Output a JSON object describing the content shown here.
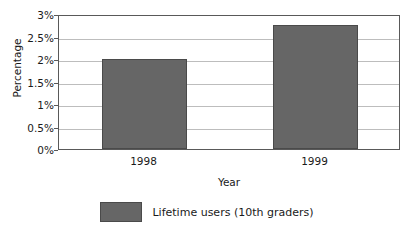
{
  "chart_data": {
    "type": "bar",
    "title": "",
    "xlabel": "Year",
    "ylabel": "Percentage",
    "categories": [
      "1998",
      "1999"
    ],
    "values": [
      2.0,
      2.75
    ],
    "series": [
      {
        "name": "Lifetime users (10th graders)",
        "values": [
          2.0,
          2.75
        ],
        "color": "#666666"
      }
    ],
    "ylim": [
      0,
      3
    ],
    "ytick_values": [
      0,
      0.5,
      1,
      1.5,
      2,
      2.5,
      3
    ],
    "ytick_labels": [
      "0%",
      "0.5%",
      "1%",
      "1.5%",
      "2%",
      "2.5%",
      "3%"
    ],
    "xtick_labels": [
      "1998",
      "1999"
    ],
    "grid": "horizontal",
    "legend_position": "bottom-center",
    "legend_entries": [
      "Lifetime users (10th graders)"
    ],
    "colors": {
      "bar_fill": "#666666",
      "bar_border": "#4a4a4a",
      "gridline": "#bdbdbd",
      "axis_border": "#595959",
      "background": "#ffffff",
      "text": "#1a1a1a"
    }
  }
}
